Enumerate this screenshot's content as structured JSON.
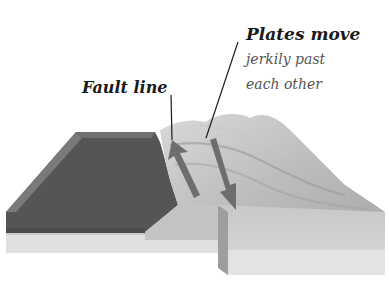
{
  "labels": {
    "fault_line": "Fault line",
    "plates_title": "Plates move",
    "plates_line1": "jerkily past",
    "plates_line2": "each other"
  },
  "colors": {
    "dark_plate_top": "#555555",
    "dark_plate_edge": "#7a7a7a",
    "light_ground": "#bdbdbd",
    "base_layer": "#e2e2e2",
    "arrow": "#6e6e6e"
  }
}
